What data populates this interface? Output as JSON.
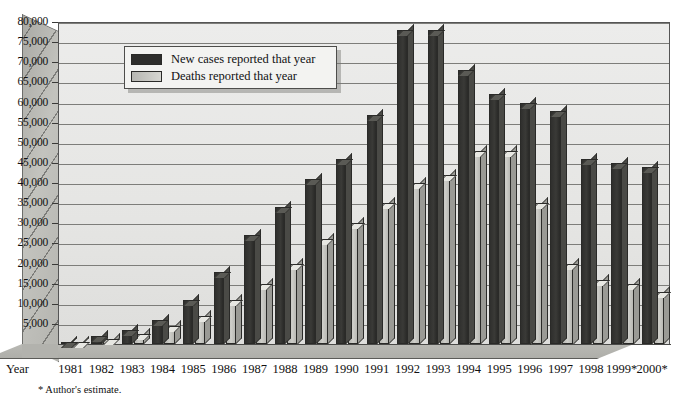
{
  "chart_data": {
    "type": "bar",
    "title": "",
    "xlabel": "Year",
    "ylabel": "",
    "ylim": [
      0,
      80000
    ],
    "grid": true,
    "legend_position": "upper-left-inside",
    "footnote": "* Author's estimate.",
    "axis_label_year": "Year",
    "categories": [
      "1981",
      "1982",
      "1983",
      "1984",
      "1985",
      "1986",
      "1987",
      "1988",
      "1989",
      "1990",
      "1991",
      "1992",
      "1993",
      "1994",
      "1995",
      "1996",
      "1997",
      "1998",
      "1999*",
      "2000*"
    ],
    "ytick_labels": [
      "5,000",
      "10,000",
      "15,000",
      "20,000",
      "25,000",
      "30,000",
      "35,000",
      "40,000",
      "45,000",
      "50,000",
      "55,000",
      "60,000",
      "65,000",
      "70,000",
      "75,000",
      "80,000"
    ],
    "ytick_values": [
      5000,
      10000,
      15000,
      20000,
      25000,
      30000,
      35000,
      40000,
      45000,
      50000,
      55000,
      60000,
      65000,
      70000,
      75000,
      80000
    ],
    "series": [
      {
        "name": "New cases reported that year",
        "color": "#2e2e2c",
        "values": [
          600,
          2000,
          3500,
          6000,
          11000,
          18000,
          27000,
          34000,
          41000,
          46000,
          57000,
          78000,
          78000,
          68000,
          62000,
          60000,
          58000,
          46000,
          45000,
          44000
        ]
      },
      {
        "name": "Deaths reported that year",
        "color": "#c6c6c1",
        "values": [
          300,
          1200,
          2400,
          4500,
          7000,
          11000,
          15000,
          20000,
          26000,
          30000,
          35000,
          40000,
          42000,
          48000,
          48000,
          35000,
          20000,
          16000,
          15000,
          13000
        ]
      }
    ]
  },
  "legend": {
    "items": [
      {
        "label": "New cases reported that year",
        "swatch": "dark-swatch"
      },
      {
        "label": "Deaths reported that year",
        "swatch": "light-swatch"
      }
    ]
  }
}
